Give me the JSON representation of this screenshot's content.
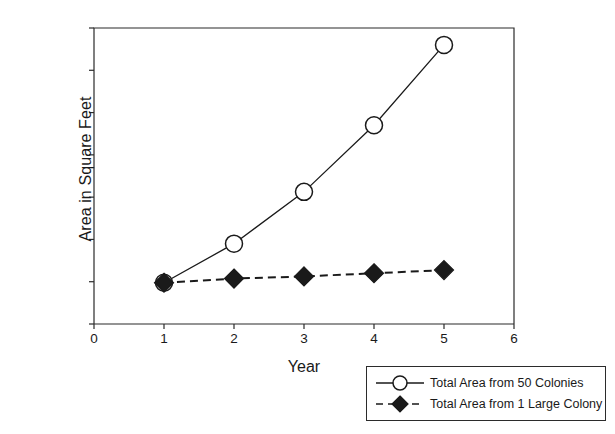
{
  "chart_data": {
    "type": "line",
    "title": "",
    "xlabel": "Year",
    "ylabel": "Area in Square Feet",
    "x": [
      1,
      2,
      3,
      4,
      5
    ],
    "xlim": [
      0,
      6
    ],
    "ylim": [
      0,
      14000
    ],
    "xticks": [
      "0",
      "1",
      "2",
      "3",
      "4",
      "5",
      "6"
    ],
    "yticks": [
      "0",
      "2000",
      "4000",
      "6000",
      "8000",
      "10000",
      "12000",
      "14000"
    ],
    "xtick_values": [
      0,
      1,
      2,
      3,
      4,
      5,
      6
    ],
    "ytick_values": [
      0,
      2000,
      4000,
      6000,
      8000,
      10000,
      12000,
      14000
    ],
    "grid": false,
    "legend_position": "below-right",
    "series": [
      {
        "name": "Total Area from 50 Colonies",
        "marker": "open-circle",
        "linestyle": "solid",
        "color": "#1a1a1a",
        "values": [
          1950,
          3800,
          6250,
          9400,
          13200
        ]
      },
      {
        "name": "Total Area from 1 Large Colony",
        "marker": "filled-diamond",
        "linestyle": "dashed",
        "color": "#1a1a1a",
        "values": [
          1950,
          2150,
          2250,
          2400,
          2550
        ]
      }
    ]
  },
  "axes": {
    "x_title": "Year",
    "y_title": "Area in Square Feet"
  },
  "legend": {
    "entries": [
      {
        "label": "Total Area from 50 Colonies"
      },
      {
        "label": "Total Area from 1 Large Colony"
      }
    ]
  },
  "colors": {
    "axis": "#2b2b2b",
    "text": "#1a1a1a",
    "background": "#ffffff",
    "series1": "#1a1a1a",
    "series2": "#1a1a1a"
  }
}
